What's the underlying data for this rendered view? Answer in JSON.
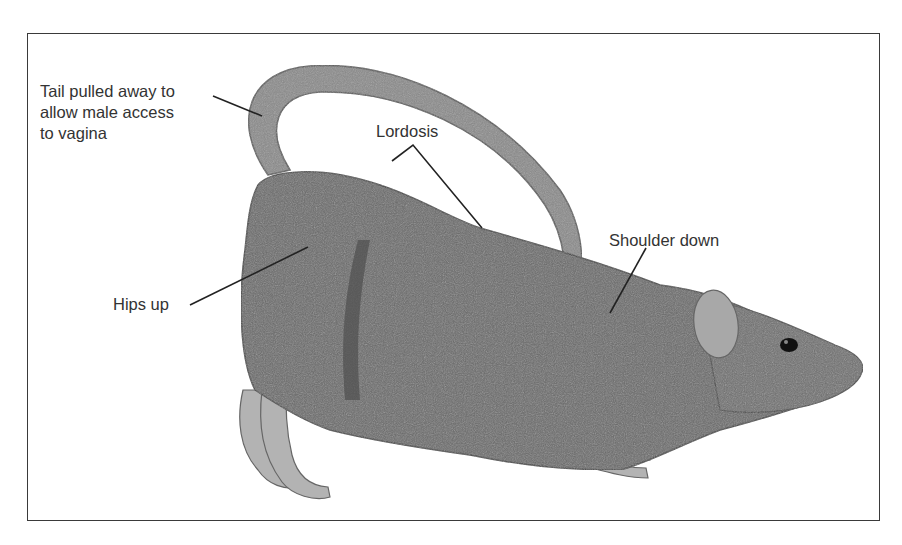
{
  "figure": {
    "labels": {
      "tail": [
        "Tail pulled away to",
        "allow male access",
        "to vagina"
      ],
      "lordosis": "Lordosis",
      "shoulder": "Shoulder down",
      "hips": "Hips up"
    },
    "colors": {
      "border": "#3a3a3a",
      "fur": "#6b6b6b",
      "fur_dark": "#4f4f4f",
      "tail": "#8a8a8a",
      "paws": "#b3b3b3",
      "text": "#333333",
      "leader_line": "#222222"
    }
  }
}
